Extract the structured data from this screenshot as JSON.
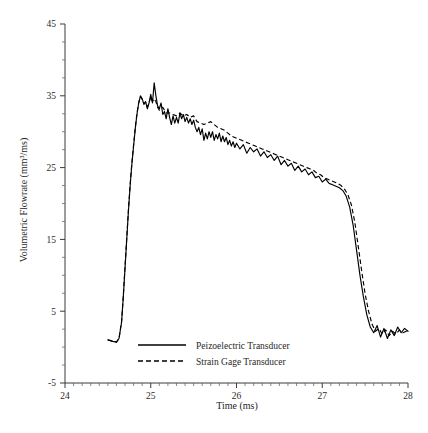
{
  "chart_data": {
    "type": "line",
    "title": "",
    "xlabel": "Time (ms)",
    "ylabel": "Volumetric Flowrate (mm³/ms)",
    "xlim": [
      24,
      28
    ],
    "ylim": [
      -5,
      45
    ],
    "xticks": [
      24,
      25,
      26,
      27,
      28
    ],
    "yticks": [
      -5,
      5,
      15,
      25,
      35,
      45
    ],
    "xtick_labels": [
      "24",
      "25",
      "26",
      "27",
      "28"
    ],
    "ytick_labels": [
      "-5",
      "5",
      "15",
      "25",
      "35",
      "45"
    ],
    "x_minor_interval": 0.1,
    "y_minor_interval": 2.5,
    "grid": false,
    "legend_position": "bottom-center-inside",
    "series": [
      {
        "name": "Peizoelectric Transducer",
        "style": "solid",
        "color": "#000000",
        "x": [
          24.5,
          24.56,
          24.6,
          24.63,
          24.66,
          24.68,
          24.7,
          24.72,
          24.74,
          24.76,
          24.78,
          24.8,
          24.82,
          24.84,
          24.86,
          24.88,
          24.9,
          24.92,
          24.94,
          24.96,
          24.98,
          25.0,
          25.02,
          25.04,
          25.06,
          25.08,
          25.1,
          25.12,
          25.14,
          25.16,
          25.18,
          25.2,
          25.22,
          25.24,
          25.26,
          25.28,
          25.3,
          25.32,
          25.34,
          25.36,
          25.38,
          25.4,
          25.42,
          25.44,
          25.46,
          25.48,
          25.5,
          25.52,
          25.54,
          25.56,
          25.58,
          25.6,
          25.62,
          25.64,
          25.66,
          25.68,
          25.7,
          25.72,
          25.74,
          25.76,
          25.78,
          25.8,
          25.82,
          25.84,
          25.86,
          25.88,
          25.9,
          25.92,
          25.94,
          25.96,
          25.98,
          26.0,
          26.04,
          26.08,
          26.12,
          26.16,
          26.2,
          26.24,
          26.28,
          26.32,
          26.36,
          26.4,
          26.44,
          26.48,
          26.52,
          26.56,
          26.6,
          26.64,
          26.68,
          26.72,
          26.76,
          26.8,
          26.84,
          26.88,
          26.92,
          26.96,
          27.0,
          27.04,
          27.08,
          27.12,
          27.16,
          27.2,
          27.24,
          27.28,
          27.32,
          27.36,
          27.4,
          27.44,
          27.48,
          27.52,
          27.56,
          27.6,
          27.64,
          27.68,
          27.72,
          27.76,
          27.8,
          27.84,
          27.88,
          27.92,
          27.96,
          28.0
        ],
        "y": [
          1.0,
          0.8,
          0.7,
          1.2,
          3.5,
          7.0,
          11.0,
          15.0,
          19.0,
          22.5,
          25.5,
          28.0,
          30.5,
          32.5,
          34.0,
          35.0,
          34.6,
          33.8,
          34.2,
          33.2,
          34.0,
          35.2,
          34.0,
          36.8,
          35.0,
          33.6,
          33.2,
          34.0,
          32.4,
          32.8,
          31.8,
          33.2,
          32.0,
          31.0,
          32.2,
          31.2,
          32.0,
          31.2,
          32.6,
          31.8,
          32.4,
          31.4,
          32.0,
          31.2,
          31.8,
          31.0,
          31.6,
          30.6,
          30.0,
          30.6,
          29.6,
          30.4,
          28.8,
          29.8,
          29.0,
          30.0,
          29.2,
          30.0,
          28.8,
          29.6,
          29.0,
          29.8,
          28.6,
          29.4,
          28.6,
          29.2,
          28.2,
          28.8,
          28.0,
          28.6,
          27.8,
          28.4,
          27.6,
          28.2,
          27.0,
          27.8,
          27.2,
          27.6,
          26.6,
          27.2,
          26.4,
          26.8,
          26.0,
          26.6,
          25.4,
          26.0,
          25.2,
          25.6,
          24.6,
          25.2,
          24.4,
          24.8,
          24.0,
          24.4,
          23.6,
          23.8,
          23.0,
          23.4,
          22.8,
          22.6,
          22.4,
          22.2,
          21.8,
          21.0,
          19.5,
          17.0,
          13.5,
          10.0,
          7.0,
          4.5,
          2.8,
          2.0,
          3.0,
          1.4,
          2.6,
          1.2,
          2.4,
          1.6,
          2.8,
          2.0,
          2.6,
          2.2
        ]
      },
      {
        "name": "Strain Gage Transducer",
        "style": "dashed",
        "color": "#000000",
        "x": [
          24.5,
          24.56,
          24.6,
          24.63,
          24.66,
          24.68,
          24.7,
          24.72,
          24.74,
          24.76,
          24.78,
          24.8,
          24.82,
          24.84,
          24.86,
          24.88,
          24.9,
          24.92,
          24.94,
          24.96,
          24.98,
          25.0,
          25.02,
          25.04,
          25.06,
          25.08,
          25.1,
          25.14,
          25.18,
          25.22,
          25.26,
          25.3,
          25.34,
          25.38,
          25.42,
          25.46,
          25.5,
          25.54,
          25.58,
          25.62,
          25.66,
          25.7,
          25.74,
          25.78,
          25.82,
          25.86,
          25.9,
          25.94,
          25.98,
          26.02,
          26.06,
          26.1,
          26.14,
          26.18,
          26.22,
          26.26,
          26.3,
          26.34,
          26.38,
          26.42,
          26.46,
          26.5,
          26.54,
          26.58,
          26.62,
          26.66,
          26.7,
          26.74,
          26.78,
          26.82,
          26.86,
          26.9,
          26.94,
          26.98,
          27.02,
          27.06,
          27.1,
          27.14,
          27.18,
          27.22,
          27.26,
          27.3,
          27.34,
          27.38,
          27.42,
          27.46,
          27.5,
          27.54,
          27.58,
          27.62,
          27.66,
          27.7,
          27.74,
          27.78,
          27.82,
          27.86,
          27.9,
          27.94,
          27.98,
          28.0
        ],
        "y": [
          1.0,
          0.8,
          0.7,
          1.2,
          3.6,
          7.2,
          11.2,
          15.2,
          19.2,
          22.7,
          25.7,
          28.2,
          30.6,
          32.6,
          34.1,
          34.9,
          34.5,
          33.9,
          34.1,
          33.4,
          34.0,
          34.8,
          34.2,
          34.6,
          34.2,
          33.4,
          33.0,
          33.4,
          32.6,
          32.6,
          32.4,
          32.2,
          32.6,
          32.2,
          32.4,
          32.0,
          32.2,
          31.4,
          31.2,
          31.0,
          31.2,
          31.4,
          31.0,
          30.6,
          30.4,
          30.2,
          29.8,
          29.4,
          29.2,
          29.0,
          28.8,
          28.6,
          28.4,
          28.2,
          28.0,
          27.8,
          27.6,
          27.4,
          27.2,
          27.0,
          26.8,
          26.6,
          26.4,
          26.2,
          26.0,
          25.8,
          25.6,
          25.4,
          25.2,
          25.0,
          24.8,
          24.6,
          24.2,
          24.0,
          23.6,
          23.4,
          23.2,
          23.0,
          22.8,
          22.5,
          22.0,
          21.2,
          19.8,
          17.4,
          14.0,
          10.6,
          7.4,
          5.0,
          3.2,
          2.2,
          2.6,
          1.8,
          2.4,
          1.6,
          2.2,
          1.8,
          2.4,
          2.0,
          2.2,
          2.2
        ]
      }
    ]
  },
  "legend": {
    "items": [
      {
        "label": "Peizoelectric Transducer",
        "style": "solid"
      },
      {
        "label": "Strain Gage Transducer",
        "style": "dashed"
      }
    ]
  }
}
